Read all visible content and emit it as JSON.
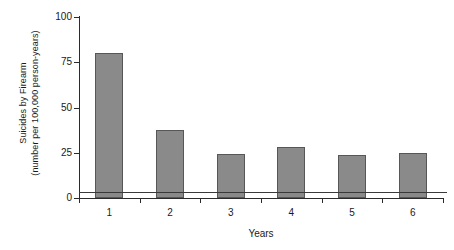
{
  "chart_data": {
    "type": "bar",
    "title": "",
    "subtitle": "",
    "categories": [
      "1",
      "2",
      "3",
      "4",
      "5",
      "6"
    ],
    "values": [
      80,
      37.5,
      24.5,
      28,
      23.5,
      25
    ],
    "series": [
      {
        "name": "Suicides by Firearm",
        "values": [
          80,
          37.5,
          24.5,
          28,
          23.5,
          25
        ]
      }
    ],
    "xlabel": "Years",
    "ylabel": "Suicides by Firearm (number per 100,000 person-years)",
    "ylabel_line1": "Suicides by Firearm",
    "ylabel_line2": "(number per 100,000 person-years)",
    "ylim": [
      0,
      100
    ],
    "yticks": [
      0,
      25,
      50,
      75,
      100
    ],
    "ytick_labels": [
      "0",
      "25",
      "50",
      "75",
      "100"
    ],
    "xtick_labels": [
      "1",
      "2",
      "3",
      "4",
      "5",
      "6"
    ],
    "grid": false,
    "legend": "none",
    "annotations": [
      {
        "name": "reference-line",
        "type": "horizontal-line",
        "value": 3.5,
        "label": ""
      }
    ],
    "colors": {
      "bar_fill": "#8a8a8a",
      "bar_border": "#575757",
      "axis": "#2b2b2b",
      "reference_line": "#3a3a3a",
      "background": "#ffffff",
      "text": "#1a1a1a"
    }
  }
}
